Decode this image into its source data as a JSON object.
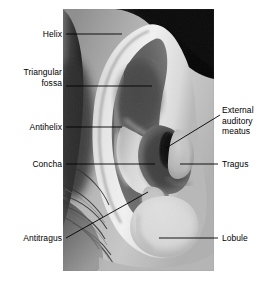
{
  "figure": {
    "background_color": "#ffffff",
    "text_color": "#000000",
    "leader_line_color": "#000000"
  },
  "photo": {
    "alt": "Black and white close-up photograph of a human ear",
    "frame": {
      "x": 63,
      "y": 9,
      "width": 151,
      "height": 262
    },
    "border_color": "#ffffff"
  },
  "labels": [
    {
      "id": "helix",
      "text": "Helix",
      "align": "right",
      "side": "left",
      "x": 6,
      "y": 29,
      "width": 56,
      "leader": {
        "x1": 66,
        "y1": 34,
        "x2": 122,
        "y2": 34,
        "type": "straight"
      }
    },
    {
      "id": "triangular-fossa",
      "text": "Triangular\nfossa",
      "align": "right",
      "side": "left",
      "x": 2,
      "y": 67,
      "width": 60,
      "leader": {
        "x1": 66,
        "y1": 86,
        "x2": 152,
        "y2": 86,
        "type": "straight"
      }
    },
    {
      "id": "antihelix",
      "text": "Antihelix",
      "align": "right",
      "side": "left",
      "x": 4,
      "y": 122,
      "width": 58,
      "leader": {
        "x1": 66,
        "y1": 127,
        "x2": 122,
        "y2": 127,
        "type": "straight"
      }
    },
    {
      "id": "concha",
      "text": "Concha",
      "align": "right",
      "side": "left",
      "x": 6,
      "y": 159,
      "width": 56,
      "leader": {
        "x1": 66,
        "y1": 164,
        "x2": 155,
        "y2": 164,
        "type": "straight"
      }
    },
    {
      "id": "antitragus",
      "text": "Antitragus",
      "align": "right",
      "side": "left",
      "x": 2,
      "y": 233,
      "width": 60,
      "leader": {
        "x1": 66,
        "y1": 238,
        "x2": 148,
        "y2": 192,
        "type": "diagonal"
      }
    },
    {
      "id": "external-auditory-meatus",
      "text": "External\nauditory\nmeatus",
      "align": "left",
      "side": "right",
      "x": 222,
      "y": 105,
      "width": 54,
      "leader": {
        "x1": 220,
        "y1": 115,
        "x2": 166,
        "y2": 148,
        "type": "diagonal"
      }
    },
    {
      "id": "tragus",
      "text": "Tragus",
      "align": "left",
      "side": "right",
      "x": 222,
      "y": 159,
      "width": 54,
      "leader": {
        "x1": 180,
        "y1": 164,
        "x2": 218,
        "y2": 164,
        "type": "straight"
      }
    },
    {
      "id": "lobule",
      "text": "Lobule",
      "align": "left",
      "side": "right",
      "x": 222,
      "y": 233,
      "width": 54,
      "leader": {
        "x1": 159,
        "y1": 238,
        "x2": 218,
        "y2": 238,
        "type": "straight"
      }
    }
  ],
  "anatomy_parts": [
    "Helix",
    "Triangular fossa",
    "Antihelix",
    "Concha",
    "Antitragus",
    "External auditory meatus",
    "Tragus",
    "Lobule"
  ]
}
